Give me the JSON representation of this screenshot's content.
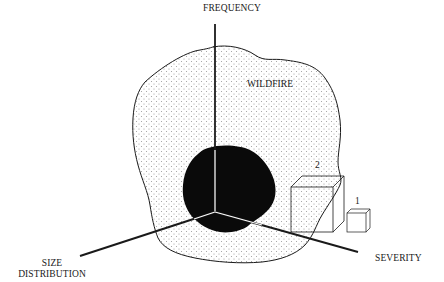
{
  "diagram": {
    "axes": {
      "vertical": "FREQUENCY",
      "left": "SIZE DISTRIBUTION",
      "left_line1": "SIZE",
      "left_line2": "DISTRIBUTION",
      "right": "SEVERITY"
    },
    "region_label": "WILDFIRE",
    "boxes": [
      {
        "label": "2",
        "size": "large"
      },
      {
        "label": "1",
        "size": "small"
      }
    ],
    "colors": {
      "line": "#1a1a1a",
      "dots": "#9a9a9a",
      "core": "#0a0a0a",
      "background": "#ffffff"
    }
  }
}
